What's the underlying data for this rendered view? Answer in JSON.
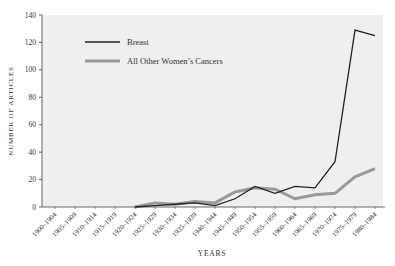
{
  "chart_data": {
    "type": "line",
    "title": "",
    "xlabel": "YEARS",
    "ylabel": "NUMBER OF ARTICLES",
    "ylim": [
      0,
      140
    ],
    "yticks": [
      0,
      20,
      40,
      60,
      80,
      100,
      120,
      140
    ],
    "grid": false,
    "legend_position": "upper-left inside plot",
    "categories": [
      "1900–1904",
      "1905–1909",
      "1910–1914",
      "1915–1919",
      "1920–1924",
      "1925–1929",
      "1930–1934",
      "1935–1939",
      "1940–1944",
      "1945–1949",
      "1950–1954",
      "1955–1959",
      "1960–1964",
      "1965–1969",
      "1970–1974",
      "1975–1979",
      "1980–1984"
    ],
    "series": [
      {
        "name": "Breast",
        "color": "#222222",
        "width": 1.3,
        "values": [
          null,
          null,
          null,
          null,
          0,
          1,
          2,
          3,
          1,
          6,
          15,
          10,
          15,
          14,
          33,
          129,
          125
        ]
      },
      {
        "name": "All Other Women’s Cancers",
        "color": "#999999",
        "width": 3,
        "values": [
          null,
          null,
          null,
          null,
          0,
          3,
          2,
          4,
          3,
          11,
          14,
          13,
          6,
          9,
          10,
          22,
          28
        ]
      }
    ]
  },
  "colors": {
    "plot_background": "#efefef",
    "axis": "#444444"
  }
}
